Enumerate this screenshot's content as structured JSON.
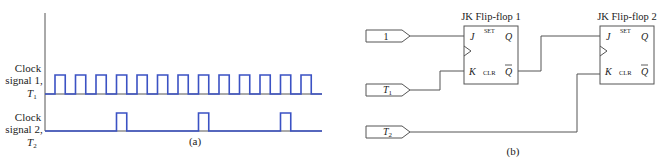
{
  "panel_a": {
    "caption": "(a)",
    "signals": [
      {
        "name": "T1",
        "label_line1": "Clock",
        "label_line2": "signal 1,",
        "label_sym": "T",
        "label_sub": "1",
        "pulse_count": 13,
        "pulse_period": 1,
        "pulse_width": 0.5,
        "first_pulse": 0
      },
      {
        "name": "T2",
        "label_line1": "Clock",
        "label_line2": "signal 2,",
        "label_sym": "T",
        "label_sub": "2",
        "pulse_positions": [
          3,
          7,
          11
        ],
        "pulse_width": 0.5
      }
    ],
    "color": "#3b52c4"
  },
  "panel_b": {
    "caption": "(b)",
    "inputs": [
      {
        "id": "one",
        "text": "1",
        "sub": ""
      },
      {
        "id": "t1",
        "text": "T",
        "sub": "1"
      },
      {
        "id": "t2",
        "text": "T",
        "sub": "2"
      }
    ],
    "flipflops": [
      {
        "title": "JK Flip-flop 1",
        "j": "J",
        "k": "K",
        "set": "SET",
        "clr": "CLR",
        "q": "Q",
        "qbar": "Q"
      },
      {
        "title": "JK Flip-flop 2",
        "j": "J",
        "k": "K",
        "set": "SET",
        "clr": "CLR",
        "q": "Q",
        "qbar": "Q"
      }
    ]
  }
}
